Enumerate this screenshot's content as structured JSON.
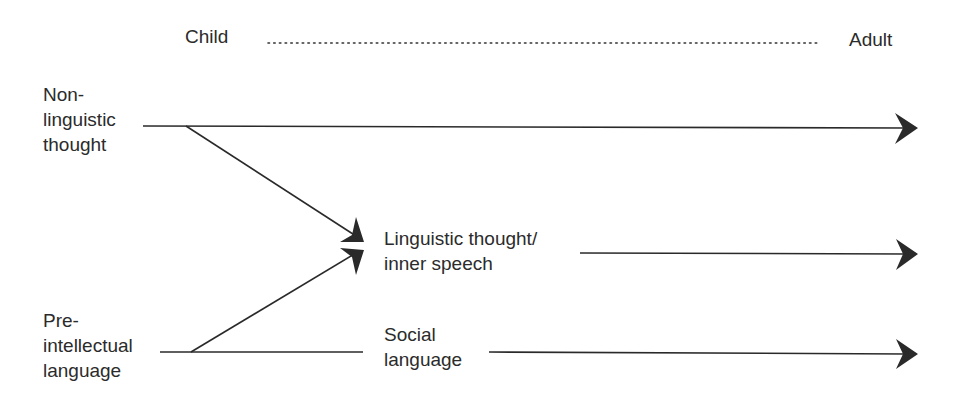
{
  "timeline": {
    "start_label": "Child",
    "end_label": "Adult"
  },
  "sources": {
    "nonlinguistic": "Non-\nlinguistic\nthought",
    "preintellectual": "Pre-\nintellectual\nlanguage"
  },
  "outcomes": {
    "linguistic_thought": "Linguistic thought/\ninner speech",
    "social_language": "Social\nlanguage"
  },
  "colors": {
    "line": "#2a2a2a",
    "text": "#2b2b2b"
  }
}
